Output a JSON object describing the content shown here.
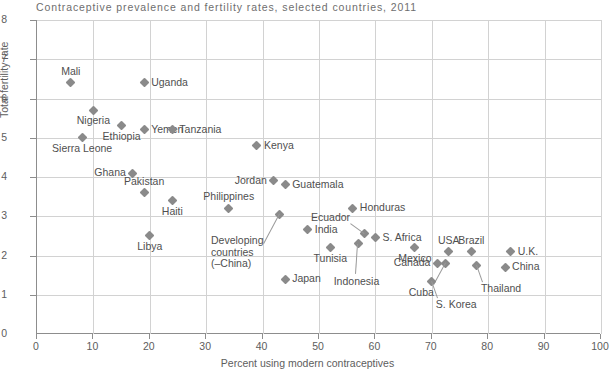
{
  "chart_data": {
    "type": "scatter",
    "title": "Contraceptive prevalence and fertility rates, selected countries, 2011",
    "xlabel": "Percent using modern contraceptives",
    "ylabel": "Total fertility rate",
    "xlim": [
      0,
      100
    ],
    "ylim": [
      0,
      8
    ],
    "xticks": [
      0,
      10,
      20,
      30,
      40,
      50,
      60,
      70,
      80,
      90,
      100
    ],
    "yticks": [
      0,
      1,
      2,
      3,
      4,
      5,
      6,
      7,
      8
    ],
    "grid": true,
    "legend": "none",
    "marker": "diamond",
    "marker_color": "#8a8a8a",
    "points": [
      {
        "name": "Mali",
        "x": 6,
        "y": 6.4,
        "label_pos": "above"
      },
      {
        "name": "Uganda",
        "x": 19,
        "y": 6.4,
        "label_pos": "right"
      },
      {
        "name": "Nigeria",
        "x": 10,
        "y": 5.7,
        "label_pos": "below"
      },
      {
        "name": "Ethiopia",
        "x": 15,
        "y": 5.3,
        "label_pos": "below"
      },
      {
        "name": "Yemen",
        "x": 19,
        "y": 5.2,
        "label_pos": "right"
      },
      {
        "name": "Tanzania",
        "x": 24,
        "y": 5.2,
        "label_pos": "right"
      },
      {
        "name": "Sierra Leone",
        "x": 8,
        "y": 5.0,
        "label_pos": "below"
      },
      {
        "name": "Kenya",
        "x": 39,
        "y": 4.8,
        "label_pos": "right"
      },
      {
        "name": "Ghana",
        "x": 17,
        "y": 4.1,
        "label_pos": "left"
      },
      {
        "name": "Jordan",
        "x": 42,
        "y": 3.9,
        "label_pos": "left"
      },
      {
        "name": "Guatemala",
        "x": 44,
        "y": 3.8,
        "label_pos": "right"
      },
      {
        "name": "Pakistan",
        "x": 19,
        "y": 3.6,
        "label_pos": "above"
      },
      {
        "name": "Haiti",
        "x": 24,
        "y": 3.4,
        "label_pos": "below"
      },
      {
        "name": "Philippines",
        "x": 34,
        "y": 3.2,
        "label_pos": "above"
      },
      {
        "name": "Honduras",
        "x": 56,
        "y": 3.2,
        "label_pos": "right"
      },
      {
        "name": "Developing countries (–China)",
        "x": 43,
        "y": 3.05,
        "label_pos": "leader-below-left"
      },
      {
        "name": "India",
        "x": 48,
        "y": 2.65,
        "label_pos": "right"
      },
      {
        "name": "Ecuador",
        "x": 58,
        "y": 2.55,
        "label_pos": "leader-above-left"
      },
      {
        "name": "S. Africa",
        "x": 60,
        "y": 2.45,
        "label_pos": "right"
      },
      {
        "name": "Libya",
        "x": 20,
        "y": 2.5,
        "label_pos": "below"
      },
      {
        "name": "Mexico",
        "x": 67,
        "y": 2.2,
        "label_pos": "below"
      },
      {
        "name": "USA",
        "x": 73,
        "y": 2.1,
        "label_pos": "above"
      },
      {
        "name": "Brazil",
        "x": 77,
        "y": 2.1,
        "label_pos": "above"
      },
      {
        "name": "U.K.",
        "x": 84,
        "y": 2.1,
        "label_pos": "right"
      },
      {
        "name": "Tunisia",
        "x": 52,
        "y": 2.2,
        "label_pos": "below"
      },
      {
        "name": "Indonesia",
        "x": 57,
        "y": 2.3,
        "label_pos": "leader-below"
      },
      {
        "name": "Canada",
        "x": 71,
        "y": 1.8,
        "label_pos": "left"
      },
      {
        "name": "Cuba",
        "x": 72.5,
        "y": 1.8,
        "label_pos": "leader-below-left"
      },
      {
        "name": "Thailand",
        "x": 78,
        "y": 1.75,
        "label_pos": "leader-below-right"
      },
      {
        "name": "China",
        "x": 83,
        "y": 1.7,
        "label_pos": "right"
      },
      {
        "name": "Japan",
        "x": 44,
        "y": 1.4,
        "label_pos": "right"
      },
      {
        "name": "S. Korea",
        "x": 70,
        "y": 1.35,
        "label_pos": "leader-below-right"
      }
    ]
  }
}
